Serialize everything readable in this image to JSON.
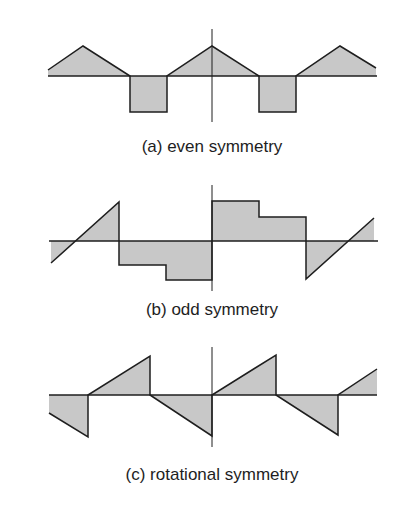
{
  "colors": {
    "fill": "#c8c8c8",
    "stroke": "#1e1e1e",
    "background": "#ffffff"
  },
  "panels": [
    {
      "id": "a",
      "caption": "(a) even symmetry",
      "axis_y": 76,
      "vaxis": {
        "x": 212,
        "y1": 29,
        "y2": 122
      },
      "waveform": "M48,70 L83,46 L130,76 L130,112 L167,112 L167,76 L212,46 L259,76 L259,112 L296,112 L296,76 L340,46 L376,68 L376,76 L48,76 Z",
      "outline": "M48,70 L83,46 L130,76 L130,112 L167,112 L167,76 L212,46 L259,76 L259,112 L296,112 L296,76 L340,46 L376,68"
    },
    {
      "id": "b",
      "caption": "(b) odd symmetry",
      "axis_y": 241,
      "vaxis": {
        "x": 212,
        "y1": 185,
        "y2": 291
      },
      "waveform": "M51,263 L119,202 L119,265 L166,265 L166,280 L212,280 L212,201 L259,201 L259,217 L306,217 L306,279 L374,218 L374,241 L51,241 Z",
      "outline": "M51,263 L119,202 L119,265 L166,265 L166,280 L212,280 L212,201 L259,201 L259,217 L306,217 L306,279 L374,218"
    },
    {
      "id": "c",
      "caption": "(c) rotational symmetry",
      "axis_y": 395,
      "vaxis": {
        "x": 212,
        "y1": 347,
        "y2": 447
      },
      "waveform": "M49,413 L88,437 L88,395 L150,356 L150,395 L212,436 L212,395 L276,355 L276,395 L338,435 L338,395 L377,369 L377,395 L49,395 Z",
      "outline": "M49,413 L88,437 L88,395 L150,356 L150,395 L212,436 L212,395 L276,355 L276,395 L338,435 L338,395 L377,369"
    }
  ]
}
